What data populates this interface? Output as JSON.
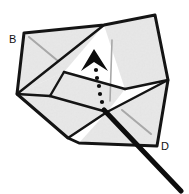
{
  "figure": {
    "background_color": "#ffffff",
    "stroke_color": "#141414",
    "face_fill_color": "#ececec",
    "crease_line_color": "#a8a8a8",
    "labels": [
      {
        "id": "label-b",
        "text": "B",
        "x": 9,
        "y": 43
      },
      {
        "id": "label-d",
        "text": "D",
        "x": 161,
        "y": 150
      }
    ],
    "faces": [
      {
        "name": "upper-left-panel",
        "points": "24,33 104,25 64,72 17,94"
      },
      {
        "name": "upper-right-panel",
        "points": "104,25 155,15 168,80 125,89"
      },
      {
        "name": "center-panel",
        "points": "64,72 125,89 107,112 50,96"
      },
      {
        "name": "lower-left-panel",
        "points": "17,94 64,72 68,138 17,94"
      },
      {
        "name": "lower-left-lower-panel",
        "points": "17,94 50,96 68,138"
      },
      {
        "name": "mid-left-panel",
        "points": "50,96 107,112 68,138"
      },
      {
        "name": "lower-right-panel",
        "points": "107,112 168,80 157,146 79,143"
      }
    ],
    "outline_edges": [
      {
        "name": "edge-top-left",
        "from": "24,33",
        "to": "104,25"
      },
      {
        "name": "edge-top-right",
        "from": "104,25",
        "to": "155,15"
      },
      {
        "name": "edge-right-upper",
        "from": "155,15",
        "to": "168,80"
      },
      {
        "name": "edge-right-lower",
        "from": "168,80",
        "to": "157,146"
      },
      {
        "name": "edge-bottom-right",
        "from": "157,146",
        "to": "79,143"
      },
      {
        "name": "edge-bottom-left",
        "from": "79,143",
        "to": "68,138"
      },
      {
        "name": "edge-lower-left-diagonal",
        "from": "68,138",
        "to": "17,94"
      },
      {
        "name": "edge-left",
        "from": "17,94",
        "to": "24,33"
      }
    ],
    "fold_edges": [
      {
        "name": "fold-main-diagonal",
        "from": "104,25",
        "to": "17,94"
      },
      {
        "name": "fold-center-left",
        "from": "64,72",
        "to": "125,89"
      },
      {
        "name": "fold-center-right",
        "from": "125,89",
        "to": "168,80"
      },
      {
        "name": "fold-vertical-left",
        "from": "64,72",
        "to": "50,96"
      },
      {
        "name": "fold-inner-left",
        "from": "17,94",
        "to": "50,96"
      },
      {
        "name": "fold-lower-diagonal",
        "from": "50,96",
        "to": "107,112"
      },
      {
        "name": "fold-lower-right",
        "from": "107,112",
        "to": "168,80"
      },
      {
        "name": "fold-bottom-vertex",
        "from": "68,138",
        "to": "107,112"
      }
    ],
    "crease_lines": [
      {
        "name": "crease-upper-left",
        "from": "29,37",
        "to": "58,61"
      },
      {
        "name": "crease-vertical-center",
        "from": "112,40",
        "to": "110,101"
      },
      {
        "name": "crease-lower-right",
        "from": "122,110",
        "to": "151,134"
      }
    ],
    "arrow": {
      "name": "fold-direction-arrow",
      "direction": "up",
      "head_points": "94,50 107,70 94,62 82,70",
      "dots": [
        {
          "cx": 96,
          "cy": 69,
          "r": 2.1
        },
        {
          "cx": 97,
          "cy": 77,
          "r": 2.1
        },
        {
          "cx": 99,
          "cy": 85,
          "r": 2.1
        },
        {
          "cx": 100,
          "cy": 93,
          "r": 2.1
        },
        {
          "cx": 102,
          "cy": 101,
          "r": 2.1
        },
        {
          "cx": 104,
          "cy": 109,
          "r": 2.1
        }
      ]
    },
    "pointer_line": {
      "name": "pointer-line-to-d",
      "from": "104,110",
      "to": "181,191",
      "width": 5
    }
  }
}
